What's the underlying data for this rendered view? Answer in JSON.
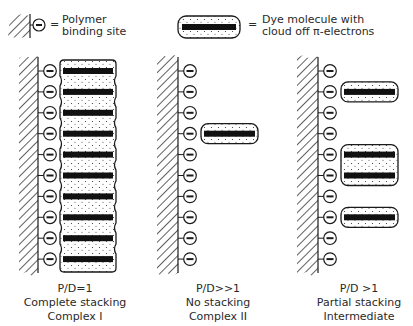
{
  "legend": {
    "binding_site_label_line1": "Polymer",
    "binding_site_label_line2": "binding site",
    "dye_label_line1": "Dye molecule with",
    "dye_label_line2": "cloud off π-electrons",
    "equals": "="
  },
  "panels": [
    {
      "id": "complex-1",
      "ratio": "P/D=1",
      "description": "Complete stacking",
      "name": "Complex I",
      "binding_sites": 10,
      "occupied_sites": [
        1,
        2,
        3,
        4,
        5,
        6,
        7,
        8,
        9,
        10
      ]
    },
    {
      "id": "complex-2",
      "ratio": "P/D>>1",
      "description": "No stacking",
      "name": "Complex II",
      "binding_sites": 10,
      "occupied_sites": [
        4
      ]
    },
    {
      "id": "intermediate",
      "ratio": "P/D >1",
      "description": "Partial stacking",
      "name": "Intermediate",
      "binding_sites": 10,
      "occupied_sites": [
        2,
        5,
        6,
        8
      ]
    }
  ],
  "colors": {
    "ink": "#1a1a1a",
    "background": "#ffffff"
  }
}
